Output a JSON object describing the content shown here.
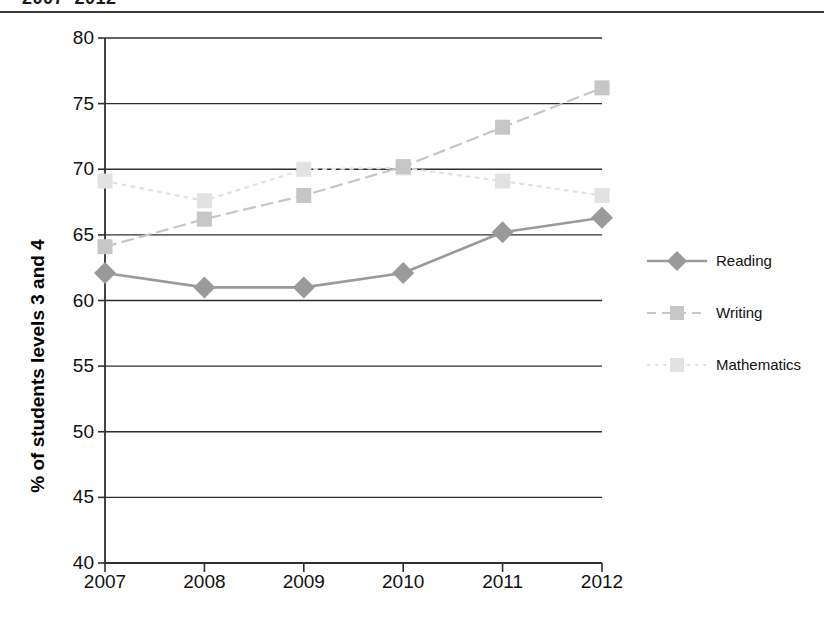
{
  "title": "2007–2012",
  "chart_data": {
    "type": "line",
    "title": "2007–2012",
    "xlabel": "",
    "ylabel": "% of students levels 3 and 4",
    "x": [
      "2007",
      "2008",
      "2009",
      "2010",
      "2011",
      "2012"
    ],
    "categories": [
      "2007",
      "2008",
      "2009",
      "2010",
      "2011",
      "2012"
    ],
    "ylim": [
      40,
      80
    ],
    "y_ticks": [
      40,
      45,
      50,
      55,
      60,
      65,
      70,
      75,
      80
    ],
    "grid": "horizontal",
    "legend_position": "right",
    "series": [
      {
        "name": "Reading",
        "values": [
          62.1,
          61.0,
          61.0,
          62.1,
          65.2,
          66.3
        ],
        "color": "#9a9a9a",
        "marker": "diamond",
        "linestyle": "solid"
      },
      {
        "name": "Writing",
        "values": [
          64.1,
          66.2,
          68.0,
          70.2,
          73.2,
          76.2
        ],
        "color": "#c6c6c6",
        "marker": "square",
        "linestyle": "dashed"
      },
      {
        "name": "Mathematics",
        "values": [
          69.1,
          67.6,
          70.0,
          70.1,
          69.1,
          68.0
        ],
        "color": "#e2e2e2",
        "marker": "square",
        "linestyle": "dotted"
      }
    ]
  },
  "legend": {
    "items": [
      {
        "label": "Reading"
      },
      {
        "label": "Writing"
      },
      {
        "label": "Mathematics"
      }
    ]
  },
  "axis": {
    "y_title": "% of students levels 3 and 4",
    "y_tick_labels": [
      "80",
      "75",
      "70",
      "65",
      "60",
      "55",
      "50",
      "45",
      "40"
    ],
    "x_tick_labels": [
      "2007",
      "2008",
      "2009",
      "2010",
      "2011",
      "2012"
    ]
  }
}
